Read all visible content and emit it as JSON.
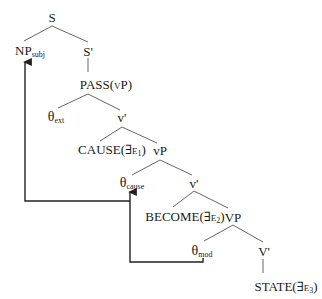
{
  "diagram": {
    "type": "syntax-tree",
    "nodes": {
      "s": {
        "label": "S"
      },
      "np_subj": {
        "label": "NP",
        "sub": "subj"
      },
      "s_bar": {
        "label": "S'"
      },
      "pass_vp": {
        "label": "PASS(vP)"
      },
      "theta_ext": {
        "label": "θ",
        "sub": "ext"
      },
      "v_bar_1": {
        "label": "v'"
      },
      "cause": {
        "label": "CAUSE(∃e",
        "sub": "1",
        "close": ")"
      },
      "vp_1": {
        "label": "vP"
      },
      "theta_cause": {
        "label": "θ",
        "sub": "cause"
      },
      "v_bar_2": {
        "label": "v'"
      },
      "become": {
        "label": "BECOME(∃e",
        "sub": "2",
        "close": ")"
      },
      "vp_2": {
        "label": "VP"
      },
      "theta_mod": {
        "label": "θ",
        "sub": "mod"
      },
      "v_bar_3": {
        "label": "V'"
      },
      "state": {
        "label": "STATE(∃e",
        "sub": "3",
        "close": ")"
      }
    },
    "movement_arrows": [
      {
        "from": "theta_cause",
        "to": "np_subj"
      },
      {
        "from": "theta_mod",
        "to": "theta_cause"
      }
    ],
    "line_color": "#555555",
    "arrow_color": "#222222"
  }
}
